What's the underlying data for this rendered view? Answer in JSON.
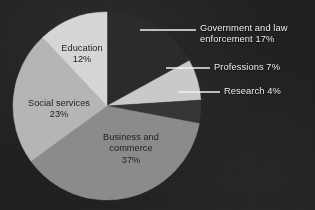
{
  "chart_data": {
    "type": "pie",
    "title": "",
    "subtitle": "",
    "xlabel": "",
    "ylabel": "",
    "legend_position": "none",
    "grid": false,
    "categories": [
      "Government and law enforcement",
      "Professions",
      "Research",
      "Business and commerce",
      "Social services",
      "Education"
    ],
    "values": [
      17,
      7,
      4,
      37,
      23,
      12
    ],
    "unit": "%",
    "start_angle_deg": 0,
    "direction": "clockwise",
    "slices": [
      {
        "name": "Government and law enforcement",
        "value": 17,
        "label": "Government and law\nenforcement 17%",
        "color": "#2b2b2b",
        "label_placement": "external",
        "start_deg": 0,
        "end_deg": 61.2
      },
      {
        "name": "Professions",
        "value": 7,
        "label": "Professions 7%",
        "color": "#c9c9c9",
        "label_placement": "external",
        "start_deg": 61.2,
        "end_deg": 86.4
      },
      {
        "name": "Research",
        "value": 4,
        "label": "Research 4%",
        "color": "#353535",
        "label_placement": "external",
        "start_deg": 86.4,
        "end_deg": 100.8
      },
      {
        "name": "Business and commerce",
        "value": 37,
        "label": "Business and\ncommerce\n37%",
        "color": "#8b8b8b",
        "label_placement": "internal",
        "start_deg": 100.8,
        "end_deg": 234.0
      },
      {
        "name": "Social services",
        "value": 23,
        "label": "Social services\n23%",
        "color": "#b5b5b5",
        "label_placement": "internal",
        "start_deg": 234.0,
        "end_deg": 316.8
      },
      {
        "name": "Education",
        "value": 12,
        "label": "Education\n12%",
        "color": "#d6d6d6",
        "label_placement": "internal",
        "start_deg": 316.8,
        "end_deg": 360.0
      }
    ]
  },
  "labels": {
    "government": "Government and law\nenforcement 17%",
    "professions": "Professions 7%",
    "research": "Research 4%",
    "business": "Business and\ncommerce\n37%",
    "social_services": "Social services\n23%",
    "education": "Education\n12%"
  },
  "colors": {
    "background": "#1c1c1c",
    "external_label_text": "#ededed",
    "internal_label_text": "#1e1e1e",
    "leader_line": "#f0f0f0",
    "slice_government": "#2b2b2b",
    "slice_professions": "#c9c9c9",
    "slice_research": "#353535",
    "slice_business": "#8b8b8b",
    "slice_social_services": "#b5b5b5",
    "slice_education": "#d6d6d6"
  }
}
